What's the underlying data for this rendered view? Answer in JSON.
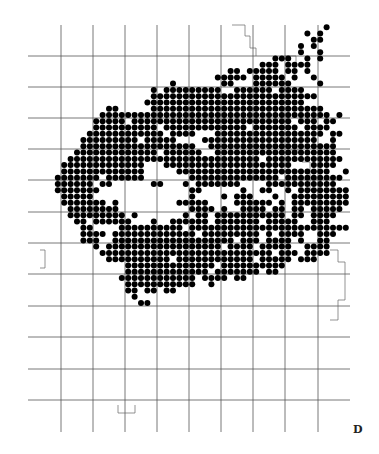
{
  "map": {
    "type": "dot-distribution-grid",
    "panel_label": "D",
    "colors": {
      "background": "#ffffff",
      "grid": "#555555",
      "dot": "#000000",
      "outline": "#666666"
    },
    "grid": {
      "vertical_lines_x": [
        61,
        93,
        125,
        157,
        189,
        221,
        253,
        285,
        318
      ],
      "vertical_span_y": [
        25,
        432
      ],
      "horizontal_lines_y": [
        56,
        87,
        118,
        149,
        180,
        212,
        243,
        274,
        306,
        337,
        369,
        400
      ],
      "horizontal_span_x": [
        28,
        350
      ]
    },
    "dot_lattice": {
      "origin_x": 32.2,
      "origin_y": 27.2,
      "pitch_x": 6.4,
      "pitch_y": 6.27,
      "radius": 3.0,
      "rows": [
        "..............................................#...",
        "...........................................#.#....",
        "............................................##....",
        "..........................................#.#.....",
        "..........................................#..#....",
        "......................................###..#.#....",
        "....................................###.####......",
        "...............................##.#####.##.#......",
        ".............................#####.#####.#..#.....",
        "......................#.......##...######....#....",
        "...................#.#########..######.####.......",
        "...................##########################.....",
        "..................#########################.......",
        "............##.....###########################......",
        "...........####################################.#.",
        "..........#####.#########################.###.##..",
        "..........##########.#############.#######.####...",
        ".........############.####...#################.##.",
        "........#########.#####....##################..#..",
        "........##################..####################..",
        ".......#############.######..###################..",
        "......##############################.############.",
        ".....#############...####################...####..",
        ".....#############.....########################..#",
        "....#######.######.......##############.#########.",
        "....######.##......##...#.#######....###########..",
        "....#######..............##......#..##..#.########",
        ".....#####...............#....#.###...#..#########",
        ".....#######.#.........#####....######.#.#########",
        "......########...........####.#..####.##.##.#####.",
        "......#########.#.......#.##.###########.##.####..",
        ".......##.######...#..######.#######.#####..###...",
        "........##....##########.#########################",
        "........####.#############.#########.#.####..###..",
        "........###..###################.###.####.#..##...",
        "..........#.##################.####.#####..####...",
        "...........###########################.###.####...",
        "............##########.############.#####.###.....",
        "...............##############.##########..........",
        "...............#############.#######.##...........",
        "..............############.####.##................",
        "...............###########..#.....................",
        "...............##.##.##...........................",
        "................#.................................",
        ".................##...............................",
        "..................................................",
        "..................................................",
        "..................................................",
        "..................................................",
        ".................................................."
      ]
    },
    "outline_steps": [
      [
        232,
        25,
        245,
        25,
        245,
        36,
        250,
        36,
        250,
        48,
        256,
        48,
        256,
        56
      ],
      [
        40,
        250,
        45,
        250,
        45,
        268,
        40,
        268
      ],
      [
        290,
        150,
        302,
        150,
        302,
        162,
        310,
        162,
        310,
        190,
        318,
        190,
        318,
        225,
        322,
        225
      ],
      [
        330,
        250,
        338,
        250,
        338,
        262,
        345,
        262,
        345,
        300,
        338,
        300,
        338,
        320,
        330,
        320
      ],
      [
        118,
        405,
        118,
        413,
        135,
        413,
        135,
        405
      ],
      [
        285,
        56,
        296,
        56,
        296,
        64
      ]
    ]
  }
}
